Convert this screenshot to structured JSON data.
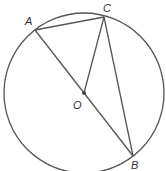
{
  "diagram": {
    "type": "circle-geometry",
    "circle": {
      "center": "O",
      "cx": 84,
      "cy": 93,
      "r": 80
    },
    "points": [
      {
        "label": "A",
        "x": 35,
        "y": 30,
        "lx": 25,
        "ly": 15
      },
      {
        "label": "C",
        "x": 104,
        "y": 17,
        "lx": 103,
        "ly": 12
      },
      {
        "label": "O",
        "x": 84,
        "y": 93,
        "lx": 73,
        "ly": 109
      },
      {
        "label": "B",
        "x": 133,
        "y": 156,
        "lx": 131,
        "ly": 169
      }
    ],
    "segments": [
      [
        "A",
        "C"
      ],
      [
        "A",
        "B"
      ],
      [
        "O",
        "C"
      ],
      [
        "C",
        "B"
      ]
    ],
    "colors": {
      "stroke": "#555555",
      "background": "#ffffff"
    }
  }
}
